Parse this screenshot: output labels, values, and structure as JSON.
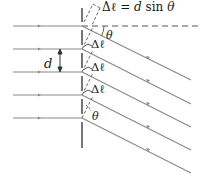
{
  "figure": {
    "type": "diffraction-grating-diagram",
    "equation": {
      "prefix": "Δℓ = ",
      "d": "d",
      "sin": " sin ",
      "theta": "θ"
    },
    "slit_spacing_label": "d",
    "path_difference_labels": [
      "Δℓ",
      "Δℓ",
      "Δℓ"
    ],
    "angle_labels": [
      "θ",
      "θ"
    ],
    "colors": {
      "rays": "#8a8a8a",
      "grating": "#555555",
      "text": "#1a1a1a",
      "dashed": "#555555"
    },
    "slit_y": [
      26,
      49,
      72,
      95,
      118
    ],
    "grating_x": 82
  }
}
